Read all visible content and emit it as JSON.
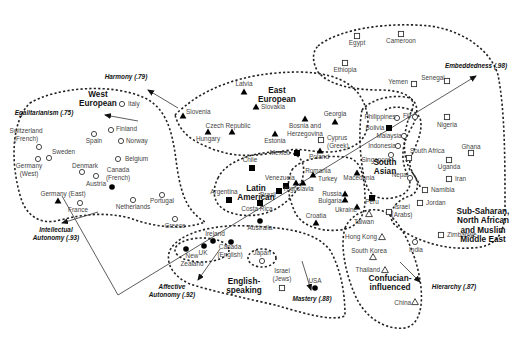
{
  "diagram": {
    "type": "cultural-map",
    "regions": [
      {
        "id": "west-european",
        "label_lines": [
          "West",
          "European"
        ],
        "x": 98,
        "y": 97
      },
      {
        "id": "east-european",
        "label_lines": [
          "East",
          "European"
        ],
        "x": 277,
        "y": 93
      },
      {
        "id": "latin-american",
        "label_lines": [
          "Latin",
          "American"
        ],
        "x": 256,
        "y": 191
      },
      {
        "id": "english-speaking",
        "label_lines": [
          "English-",
          "speaking"
        ],
        "x": 244,
        "y": 284
      },
      {
        "id": "south-asian",
        "label_lines": [
          "South",
          "Asian"
        ],
        "x": 385,
        "y": 165
      },
      {
        "id": "confucian-influenced",
        "label_lines": [
          "Confucian-",
          "influenced"
        ],
        "x": 390,
        "y": 281
      },
      {
        "id": "sub-saharan",
        "label_lines": [
          "Sub-Saharan,",
          "North African",
          "and Muslim",
          "Middle East"
        ],
        "x": 483,
        "y": 214
      }
    ],
    "axes": [
      {
        "id": "egalitarianism",
        "label": "Egalitarianism (.75)",
        "x": 44,
        "y": 115
      },
      {
        "id": "harmony",
        "label": "Harmony (.79)",
        "x": 126,
        "y": 79
      },
      {
        "id": "embeddedness",
        "label": "Embeddedness (.98)",
        "x": 476,
        "y": 68
      },
      {
        "id": "intellectual-autonomy",
        "label_lines": [
          "Intellectual",
          "Autonomy (.93)"
        ],
        "x": 56,
        "y": 232
      },
      {
        "id": "affective-autonomy",
        "label_lines": [
          "Affective",
          "Autonomy (.92)"
        ],
        "x": 172,
        "y": 289
      },
      {
        "id": "mastery",
        "label": "Mastery (.88)",
        "x": 312,
        "y": 301
      },
      {
        "id": "hierarchy",
        "label": "Hierarchy (.87)",
        "x": 454,
        "y": 289
      }
    ],
    "countries": [
      {
        "name": "Italy",
        "marker": "open-circle",
        "x": 122,
        "y": 104,
        "lx": 128,
        "ly": 106,
        "anchor": "start"
      },
      {
        "name": "Finland",
        "marker": "open-circle",
        "x": 111,
        "y": 130,
        "lx": 116,
        "ly": 131,
        "anchor": "start"
      },
      {
        "name": "Norway",
        "marker": "open-circle",
        "x": 121,
        "y": 141,
        "lx": 126,
        "ly": 143,
        "anchor": "start"
      },
      {
        "name": "Belgium",
        "marker": "open-circle",
        "x": 118,
        "y": 159,
        "lx": 125,
        "ly": 161,
        "anchor": "start"
      },
      {
        "name": "Switzerland",
        "marker": "open-circle",
        "x": 39,
        "y": 147,
        "lx": 26,
        "ly": 133,
        "anchor": "middle",
        "label2": "(French)",
        "ly2": 141
      },
      {
        "name": "Spain",
        "marker": "open-circle",
        "x": 94,
        "y": 134,
        "lx": 94,
        "ly": 143,
        "anchor": "middle"
      },
      {
        "name": "Sweden",
        "marker": "open-circle",
        "x": 49,
        "y": 158,
        "lx": 52,
        "ly": 154,
        "anchor": "start"
      },
      {
        "name": "Germany",
        "marker": "open-circle",
        "x": 38,
        "y": 159,
        "lx": 29,
        "ly": 168,
        "anchor": "middle",
        "label2": "(West)",
        "ly2": 176
      },
      {
        "name": "Denmark",
        "marker": "open-circle",
        "x": 82,
        "y": 172,
        "lx": 85,
        "ly": 168,
        "anchor": "middle"
      },
      {
        "name": "Austria",
        "marker": "open-circle",
        "x": 96,
        "y": 176,
        "lx": 96,
        "ly": 186,
        "anchor": "middle"
      },
      {
        "name": "Canada",
        "marker": "filled-circle",
        "x": 112,
        "y": 187,
        "lx": 118,
        "ly": 172,
        "anchor": "middle",
        "label2": "(French)",
        "ly2": 180
      },
      {
        "name": "Portugal",
        "marker": "open-circle",
        "x": 162,
        "y": 195,
        "lx": 162,
        "ly": 203,
        "anchor": "middle"
      },
      {
        "name": "Netherlands",
        "marker": "open-circle",
        "x": 133,
        "y": 200,
        "lx": 133,
        "ly": 209,
        "anchor": "middle"
      },
      {
        "name": "Greece",
        "marker": "open-circle",
        "x": 175,
        "y": 219,
        "lx": 175,
        "ly": 228,
        "anchor": "middle"
      },
      {
        "name": "Germany (East)",
        "marker": "filled-triangle",
        "x": 58,
        "y": 201,
        "lx": 63,
        "ly": 196,
        "anchor": "middle"
      },
      {
        "name": "France",
        "marker": "open-circle",
        "x": 80,
        "y": 203,
        "lx": 78,
        "ly": 212,
        "anchor": "middle"
      },
      {
        "name": "Slovenia",
        "marker": "filled-triangle",
        "x": 183,
        "y": 116,
        "lx": 186,
        "ly": 114,
        "anchor": "start"
      },
      {
        "name": "Latvia",
        "marker": "filled-triangle",
        "x": 244,
        "y": 92,
        "lx": 244,
        "ly": 86,
        "anchor": "middle"
      },
      {
        "name": "Slovakia",
        "marker": "filled-triangle",
        "x": 256,
        "y": 107,
        "lx": 261,
        "ly": 109,
        "anchor": "start"
      },
      {
        "name": "Czech Republic",
        "marker": "filled-triangle",
        "x": 232,
        "y": 132,
        "lx": 228,
        "ly": 128,
        "anchor": "middle"
      },
      {
        "name": "Hungary",
        "marker": "filled-triangle",
        "x": 208,
        "y": 132,
        "lx": 208,
        "ly": 141,
        "anchor": "middle"
      },
      {
        "name": "Estonia",
        "marker": "filled-triangle",
        "x": 275,
        "y": 134,
        "lx": 275,
        "ly": 143,
        "anchor": "middle"
      },
      {
        "name": "Bosnia and",
        "marker": "filled-triangle",
        "x": 305,
        "y": 119,
        "lx": 305,
        "ly": 128,
        "anchor": "middle",
        "label2": "Herzegovina",
        "ly2": 136
      },
      {
        "name": "Georgia",
        "marker": "filled-triangle",
        "x": 335,
        "y": 122,
        "lx": 335,
        "ly": 116,
        "anchor": "middle"
      },
      {
        "name": "Cyprus",
        "marker": "open-square",
        "x": 321,
        "y": 140,
        "lx": 327,
        "ly": 140,
        "anchor": "start",
        "label2": "(Greek)",
        "ly2": 148
      },
      {
        "name": "Mexico",
        "marker": "filled-square",
        "x": 297,
        "y": 153,
        "lx": 290,
        "ly": 155,
        "anchor": "end"
      },
      {
        "name": "Poland",
        "marker": "filled-triangle",
        "x": 320,
        "y": 151,
        "lx": 319,
        "ly": 159,
        "anchor": "middle"
      },
      {
        "name": "Chile",
        "marker": "filled-square",
        "x": 252,
        "y": 168,
        "lx": 250,
        "ly": 162,
        "anchor": "middle"
      },
      {
        "name": "Argentina",
        "marker": "filled-square",
        "x": 229,
        "y": 200,
        "lx": 224,
        "ly": 194,
        "anchor": "middle"
      },
      {
        "name": "Venezuela",
        "marker": "filled-square",
        "x": 286,
        "y": 186,
        "lx": 280,
        "ly": 180,
        "anchor": "middle"
      },
      {
        "name": "Brazil",
        "marker": "filled-square",
        "x": 279,
        "y": 191,
        "lx": 268,
        "ly": 197,
        "anchor": "middle"
      },
      {
        "name": "Costa Rica",
        "marker": "filled-square",
        "x": 260,
        "y": 203,
        "lx": 257,
        "ly": 211,
        "anchor": "middle"
      },
      {
        "name": "Romania",
        "marker": "filled-triangle",
        "x": 313,
        "y": 175,
        "lx": 318,
        "ly": 173,
        "anchor": "middle"
      },
      {
        "name": "Turkey",
        "marker": "filled-triangle",
        "x": 303,
        "y": 183,
        "lx": 318,
        "ly": 181,
        "anchor": "start"
      },
      {
        "name": "Yugoslavia",
        "marker": "filled-triangle",
        "x": 296,
        "y": 183,
        "lx": 298,
        "ly": 191,
        "anchor": "middle"
      },
      {
        "name": "Macedonia",
        "marker": "filled-triangle",
        "x": 357,
        "y": 173,
        "lx": 359,
        "ly": 180,
        "anchor": "middle"
      },
      {
        "name": "Russia",
        "marker": "filled-triangle",
        "x": 345,
        "y": 194,
        "lx": 332,
        "ly": 196,
        "anchor": "middle"
      },
      {
        "name": "Bulgaria",
        "marker": "filled-triangle",
        "x": 345,
        "y": 200,
        "lx": 330,
        "ly": 203,
        "anchor": "middle"
      },
      {
        "name": "Ukraine",
        "marker": "filled-triangle",
        "x": 357,
        "y": 207,
        "lx": 346,
        "ly": 212,
        "anchor": "middle"
      },
      {
        "name": "Croatia",
        "marker": "filled-triangle",
        "x": 316,
        "y": 223,
        "lx": 316,
        "ly": 218,
        "anchor": "middle"
      },
      {
        "name": "Australia",
        "marker": "filled-circle",
        "x": 260,
        "y": 221,
        "lx": 260,
        "ly": 230,
        "anchor": "middle"
      },
      {
        "name": "Ireland",
        "marker": "filled-circle",
        "x": 213,
        "y": 241,
        "lx": 215,
        "ly": 236,
        "anchor": "middle"
      },
      {
        "name": "UK",
        "marker": "filled-circle",
        "x": 204,
        "y": 246,
        "lx": 203,
        "ly": 255,
        "anchor": "middle"
      },
      {
        "name": "New",
        "marker": "filled-circle",
        "x": 186,
        "y": 249,
        "lx": 192,
        "ly": 258,
        "anchor": "middle",
        "label2": "Zealand",
        "ly2": 266
      },
      {
        "name": "Canada",
        "marker": "filled-circle",
        "x": 231,
        "y": 242,
        "lx": 230,
        "ly": 249,
        "anchor": "middle",
        "label2": "(English)",
        "ly2": 257
      },
      {
        "name": "Japan",
        "marker": "open-circle",
        "x": 262,
        "y": 261,
        "lx": 262,
        "ly": 255,
        "anchor": "middle"
      },
      {
        "name": "Israel",
        "marker": "open-square",
        "x": 282,
        "y": 288,
        "lx": 282,
        "ly": 273,
        "anchor": "middle",
        "label2": "(Jews)",
        "ly2": 281
      },
      {
        "name": "USA",
        "marker": "filled-circle",
        "x": 315,
        "y": 288,
        "lx": 315,
        "ly": 283,
        "anchor": "middle"
      },
      {
        "name": "Egypt",
        "marker": "open-square",
        "x": 357,
        "y": 36,
        "lx": 357,
        "ly": 45,
        "anchor": "middle"
      },
      {
        "name": "Cameroon",
        "marker": "open-square",
        "x": 401,
        "y": 34,
        "lx": 401,
        "ly": 43,
        "anchor": "middle"
      },
      {
        "name": "Ethiopia",
        "marker": "open-square",
        "x": 345,
        "y": 63,
        "lx": 345,
        "ly": 72,
        "anchor": "middle"
      },
      {
        "name": "Yemen",
        "marker": "open-square",
        "x": 414,
        "y": 84,
        "lx": 408,
        "ly": 84,
        "anchor": "end"
      },
      {
        "name": "Senegal",
        "marker": "open-square",
        "x": 447,
        "y": 81,
        "lx": 433,
        "ly": 80,
        "anchor": "middle"
      },
      {
        "name": "Philippines",
        "marker": "open-circle",
        "x": 397,
        "y": 118,
        "lx": 380,
        "ly": 119,
        "anchor": "middle"
      },
      {
        "name": "Fiji",
        "marker": "open-circle",
        "x": 415,
        "y": 117,
        "lx": 407,
        "ly": 118,
        "anchor": "middle"
      },
      {
        "name": "Nigeria",
        "marker": "open-square",
        "x": 447,
        "y": 117,
        "lx": 447,
        "ly": 127,
        "anchor": "middle"
      },
      {
        "name": "Bolivia",
        "marker": "filled-square",
        "x": 389,
        "y": 128,
        "lx": 375,
        "ly": 130,
        "anchor": "middle"
      },
      {
        "name": "Malaysia",
        "marker": "open-circle",
        "x": 404,
        "y": 136,
        "lx": 389,
        "ly": 138,
        "anchor": "middle"
      },
      {
        "name": "Indonesia",
        "marker": "open-circle",
        "x": 398,
        "y": 146,
        "lx": 382,
        "ly": 148,
        "anchor": "middle"
      },
      {
        "name": "South Africa",
        "marker": "open-square",
        "x": 409,
        "y": 158,
        "lx": 410,
        "ly": 153,
        "anchor": "start"
      },
      {
        "name": "Ghana",
        "marker": "open-square",
        "x": 471,
        "y": 153,
        "lx": 471,
        "ly": 149,
        "anchor": "middle"
      },
      {
        "name": "Singapore",
        "marker": "open-circle",
        "x": 391,
        "y": 155,
        "lx": 376,
        "ly": 162,
        "anchor": "middle"
      },
      {
        "name": "Uganda",
        "marker": "open-square",
        "x": 449,
        "y": 160,
        "lx": 449,
        "ly": 169,
        "anchor": "middle"
      },
      {
        "name": "Nepal",
        "marker": "open-circle",
        "x": 410,
        "y": 178,
        "lx": 400,
        "ly": 177,
        "anchor": "middle"
      },
      {
        "name": "Iran",
        "marker": "open-square",
        "x": 449,
        "y": 179,
        "lx": 455,
        "ly": 181,
        "anchor": "start"
      },
      {
        "name": "Namibia",
        "marker": "open-square",
        "x": 425,
        "y": 190,
        "lx": 431,
        "ly": 192,
        "anchor": "start"
      },
      {
        "name": "Peru",
        "marker": "filled-square",
        "x": 372,
        "y": 198,
        "lx": 372,
        "ly": 204,
        "anchor": "middle"
      },
      {
        "name": "Jordan",
        "marker": "open-square",
        "x": 420,
        "y": 203,
        "lx": 426,
        "ly": 205,
        "anchor": "start"
      },
      {
        "name": "Taiwan",
        "marker": "open-triangle",
        "x": 369,
        "y": 214,
        "lx": 364,
        "ly": 224,
        "anchor": "middle"
      },
      {
        "name": "Israel",
        "marker": "open-square",
        "x": 389,
        "y": 212,
        "lx": 402,
        "ly": 209,
        "anchor": "middle",
        "label2": "(Arabs)",
        "ly2": 217
      },
      {
        "name": "Zimbabwe",
        "marker": "open-square",
        "x": 441,
        "y": 235,
        "lx": 447,
        "ly": 237,
        "anchor": "start"
      },
      {
        "name": "Hong Kong",
        "marker": "open-triangle",
        "x": 382,
        "y": 237,
        "lx": 377,
        "ly": 239,
        "anchor": "end"
      },
      {
        "name": "India",
        "marker": "open-circle",
        "x": 415,
        "y": 242,
        "lx": 416,
        "ly": 252,
        "anchor": "middle"
      },
      {
        "name": "South Korea",
        "marker": "open-triangle",
        "x": 373,
        "y": 257,
        "lx": 369,
        "ly": 253,
        "anchor": "middle"
      },
      {
        "name": "Thailand",
        "marker": "open-triangle",
        "x": 385,
        "y": 270,
        "lx": 380,
        "ly": 272,
        "anchor": "end"
      },
      {
        "name": "China",
        "marker": "open-triangle",
        "x": 415,
        "y": 302,
        "lx": 411,
        "ly": 305,
        "anchor": "end"
      }
    ]
  }
}
